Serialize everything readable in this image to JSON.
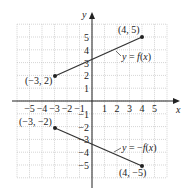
{
  "chart_data": {
    "type": "line",
    "title": "",
    "xlabel": "x",
    "ylabel": "y",
    "xlim": [
      -6,
      6
    ],
    "ylim": [
      -6,
      6
    ],
    "grid": true,
    "x_ticks": [
      "−5",
      "−4",
      "−3",
      "−2",
      "−1",
      "1",
      "2",
      "3",
      "4",
      "5"
    ],
    "y_ticks": [
      "5",
      "4",
      "3",
      "2",
      "1",
      "−1",
      "−2",
      "−3",
      "−4",
      "−5"
    ],
    "series": [
      {
        "name": "y = f(x)",
        "points": [
          [
            -3,
            2
          ],
          [
            4,
            5
          ]
        ],
        "point_labels": [
          "(−3, 2)",
          "(4, 5)"
        ]
      },
      {
        "name": "y = −f(x)",
        "points": [
          [
            -3,
            -2
          ],
          [
            4,
            -5
          ]
        ],
        "point_labels": [
          "(−3, −2)",
          "(4, −5)"
        ]
      }
    ],
    "annotations": [
      "y = f(x)",
      "y = −f(x)"
    ]
  },
  "labels": {
    "x_axis": "x",
    "y_axis": "y",
    "f_prefix": "y = ",
    "f_func": "f",
    "f_suffix": "(x)",
    "negf_prefix": "y = −",
    "negf_func": "f",
    "negf_suffix": "(x)",
    "p1": "(−3, 2)",
    "p2": "(4, 5)",
    "p3": "(−3, −2)",
    "p4": "(4, −5)"
  },
  "colors": {
    "line": "#333333",
    "grid": "#b8b8b8",
    "axis": "#222222"
  }
}
